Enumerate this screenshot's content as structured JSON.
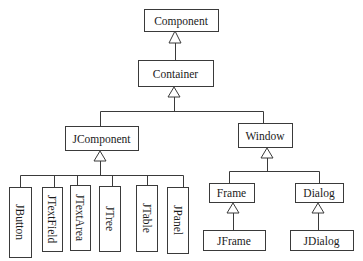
{
  "diagram": {
    "type": "uml-class-hierarchy",
    "relationship": "inheritance",
    "nodes": [
      {
        "id": "component",
        "label": "Component",
        "parent": null,
        "orientation": "horizontal"
      },
      {
        "id": "container",
        "label": "Container",
        "parent": "component",
        "orientation": "horizontal"
      },
      {
        "id": "jcomponent",
        "label": "JComponent",
        "parent": "container",
        "orientation": "horizontal"
      },
      {
        "id": "window",
        "label": "Window",
        "parent": "container",
        "orientation": "horizontal"
      },
      {
        "id": "jbutton",
        "label": "JButton",
        "parent": "jcomponent",
        "orientation": "vertical"
      },
      {
        "id": "jtextfield",
        "label": "JTextField",
        "parent": "jcomponent",
        "orientation": "vertical"
      },
      {
        "id": "jtextarea",
        "label": "JTextArea",
        "parent": "jcomponent",
        "orientation": "vertical"
      },
      {
        "id": "jtree",
        "label": "JTree",
        "parent": "jcomponent",
        "orientation": "vertical"
      },
      {
        "id": "jtable",
        "label": "JTable",
        "parent": "jcomponent",
        "orientation": "vertical"
      },
      {
        "id": "jpanel",
        "label": "JPanel",
        "parent": "jcomponent",
        "orientation": "vertical"
      },
      {
        "id": "frame",
        "label": "Frame",
        "parent": "window",
        "orientation": "horizontal"
      },
      {
        "id": "dialog",
        "label": "Dialog",
        "parent": "window",
        "orientation": "horizontal"
      },
      {
        "id": "jframe",
        "label": "JFrame",
        "parent": "frame",
        "orientation": "horizontal"
      },
      {
        "id": "jdialog",
        "label": "JDialog",
        "parent": "dialog",
        "orientation": "horizontal"
      }
    ],
    "colors": {
      "stroke": "#3a3a3a",
      "text": "#1a1a1a",
      "background": "#ffffff"
    }
  }
}
